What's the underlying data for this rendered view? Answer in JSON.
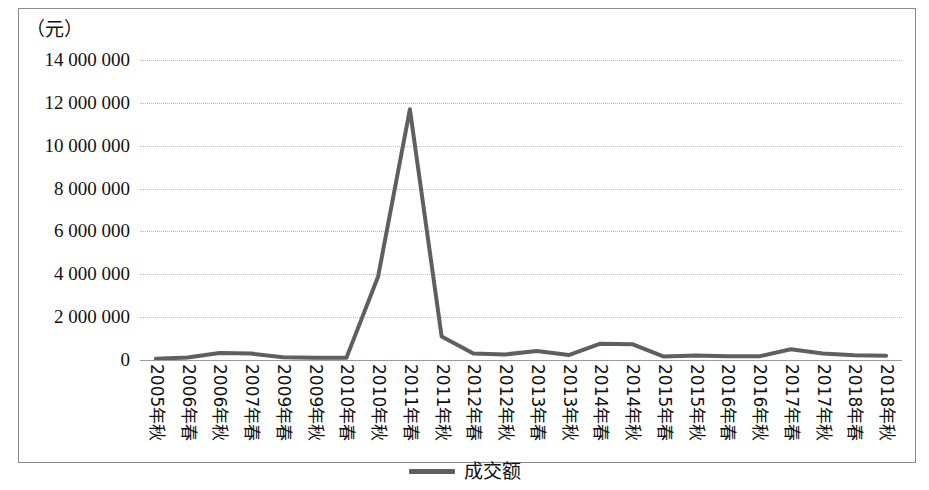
{
  "figure": {
    "unit_label": "（元）"
  },
  "legend": {
    "position": "bottom-center",
    "entries": [
      {
        "label": "成交额",
        "color": "#5f5f5f"
      }
    ],
    "label": "成交额"
  },
  "chart_data": {
    "type": "line",
    "title": "",
    "subtitle": "",
    "xlabel": "",
    "ylabel": "（元）",
    "unit": "元",
    "grid": true,
    "grid_axis": "y",
    "legend_position": "bottom-center",
    "line_color": "#5f5f5f",
    "line_width": 4,
    "markers": false,
    "ylim": [
      0,
      14000000
    ],
    "ytick_step": 2000000,
    "ytick_labels": [
      "14 000 000",
      "12 000 000",
      "10 000 000",
      "8 000 000",
      "6 000 000",
      "4 000 000",
      "2 000 000",
      "0"
    ],
    "ytick_values": [
      14000000,
      12000000,
      10000000,
      8000000,
      6000000,
      4000000,
      2000000,
      0
    ],
    "categories": [
      "2005年秋",
      "2006年春",
      "2006年秋",
      "2007年春",
      "2009年春",
      "2009年秋",
      "2010年春",
      "2010年秋",
      "2011年春",
      "2011年秋",
      "2012年春",
      "2012年秋",
      "2013年春",
      "2013年秋",
      "2014年春",
      "2014年秋",
      "2015年春",
      "2015年秋",
      "2016年春",
      "2016年秋",
      "2017年春",
      "2017年秋",
      "2018年春",
      "2018年秋"
    ],
    "series": [
      {
        "name": "成交额",
        "color": "#5f5f5f",
        "values": [
          60000,
          120000,
          330000,
          300000,
          130000,
          110000,
          100000,
          3900000,
          11700000,
          1100000,
          300000,
          260000,
          420000,
          230000,
          760000,
          740000,
          160000,
          210000,
          180000,
          170000,
          500000,
          300000,
          220000,
          200000
        ]
      }
    ]
  }
}
